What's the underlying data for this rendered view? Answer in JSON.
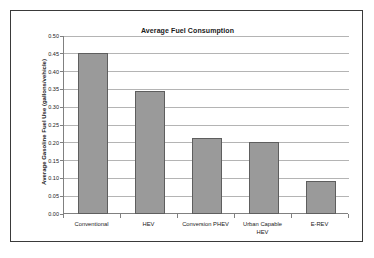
{
  "chart_data": {
    "type": "bar",
    "title": "Average Fuel Consumption",
    "xlabel": "",
    "ylabel": "Average Gasoline Fuel Use (gallons/vehicle)",
    "categories": [
      "Conventional",
      "HEV",
      "Conversion PHEV",
      "Urban Capable HEV",
      "E-REV"
    ],
    "category_lines": [
      [
        "Conventional"
      ],
      [
        "HEV"
      ],
      [
        "Conversion PHEV"
      ],
      [
        "Urban Capable",
        "HEV"
      ],
      [
        "E-REV"
      ]
    ],
    "values": [
      0.452,
      0.345,
      0.213,
      0.202,
      0.092
    ],
    "ylim": [
      0.0,
      0.5
    ],
    "ytick_values": [
      0.0,
      0.05,
      0.1,
      0.15,
      0.2,
      0.25,
      0.3,
      0.35,
      0.4,
      0.45,
      0.5
    ],
    "ytick_labels": [
      "0.00",
      "0.05",
      "0.10",
      "0.15",
      "0.20",
      "0.25",
      "0.30",
      "0.35",
      "0.40",
      "0.45",
      "0.50"
    ],
    "grid": true,
    "legend": false,
    "bar_color": "#9a9a9a",
    "bar_border_color": "#5e5e5e",
    "gridline_color": "#b4b4b4",
    "axis_color": "#808080",
    "frame_color": "#3a3a3a",
    "background_color": "#ffffff",
    "text_color": "#1a1a1a"
  }
}
